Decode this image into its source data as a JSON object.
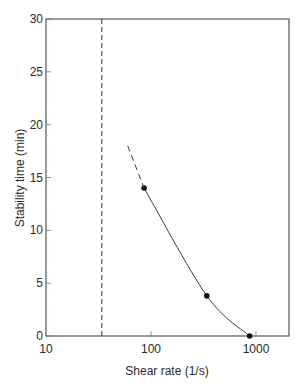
{
  "chart_data": {
    "type": "line",
    "title": "",
    "xlabel": "Shear rate (1/s)",
    "ylabel": "Stability time (min)",
    "xscale": "log",
    "xlim": [
      10,
      2000
    ],
    "ylim": [
      0,
      30
    ],
    "x_ticks": [
      10,
      100,
      1000
    ],
    "x_tick_labels": [
      "10",
      "100",
      "1000"
    ],
    "y_ticks": [
      0,
      5,
      10,
      15,
      20,
      25,
      30
    ],
    "y_tick_labels": [
      "0",
      "5",
      "10",
      "15",
      "20",
      "25",
      "30"
    ],
    "grid": false,
    "legend": null,
    "series": [
      {
        "name": "measured",
        "style": "markers+smooth-line",
        "x": [
          86,
          340,
          870
        ],
        "y": [
          14,
          3.8,
          0
        ]
      },
      {
        "name": "extrapolation",
        "style": "dashed",
        "x": [
          60,
          86
        ],
        "y": [
          18,
          14
        ]
      }
    ],
    "annotations": [
      {
        "type": "vertical-dashed-line",
        "x": 34
      }
    ]
  }
}
